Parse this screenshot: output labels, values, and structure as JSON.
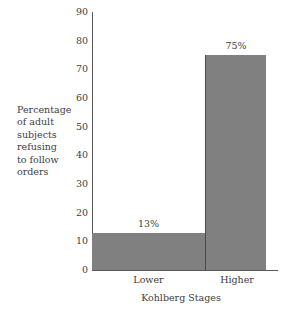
{
  "chart_data": {
    "type": "bar",
    "title": "",
    "categories": [
      "Lower",
      "Higher"
    ],
    "values": [
      13,
      75
    ],
    "data_labels": [
      "13%",
      "75%"
    ],
    "xlabel": "Kohlberg Stages",
    "ylabel": "Percentage\nof adult\nsubjects\nrefusing\nto follow\norders",
    "ylim": [
      0,
      90
    ],
    "ytick_step": 10,
    "yticks": [
      0,
      10,
      20,
      30,
      40,
      50,
      60,
      70,
      80,
      90
    ],
    "ytick_labels": [
      "0",
      "10",
      "20",
      "30",
      "40",
      "50",
      "60",
      "70",
      "80",
      "90"
    ],
    "grid": false,
    "legend": false,
    "bar_color": "#808080",
    "axis_color": "#585858",
    "text_color": "#3d3d3d"
  },
  "axes": {
    "y_title": "Percentage\nof adult\nsubjects\nrefusing\nto follow\norders",
    "x_title": "Kohlberg Stages"
  }
}
